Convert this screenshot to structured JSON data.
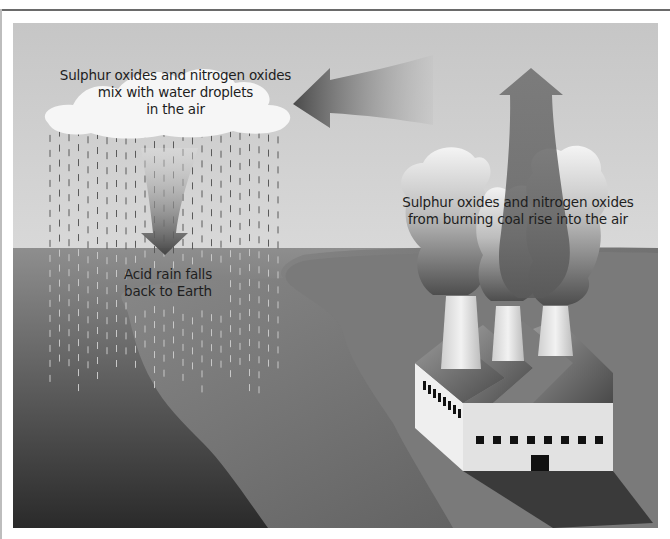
{
  "diagram": {
    "labels": {
      "cloud": [
        "Sulphur oxides and nitrogen oxides",
        "mix with water droplets",
        "in the air"
      ],
      "rain": [
        "Acid rain falls",
        "back to Earth"
      ],
      "factory": [
        "Sulphur oxides and  nitrogen oxides",
        "from burning coal rise into the air"
      ]
    },
    "elements": {
      "cloud": "rain-cloud",
      "rain": "acid-rain-drops",
      "down_arrow": "arrow-down-icon",
      "left_arrow": "arrow-left-icon",
      "up_arrow": "arrow-up-icon",
      "factory": "factory-with-three-chimneys",
      "smoke": "smoke-plumes",
      "land": "land",
      "water": "sea"
    },
    "colors": {
      "sky_top": "#c8c8c8",
      "sky_bottom": "#ededed",
      "sea_top": "#8a8a8a",
      "sea_bottom": "#2e2e2e",
      "land": "#7a7a7a",
      "factory_wall": "#e6e6e6",
      "arrow_dark": "#4a4a4a",
      "text": "#1e1e1e"
    }
  }
}
